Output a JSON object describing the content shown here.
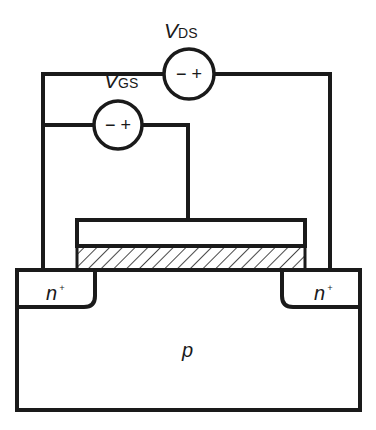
{
  "diagram": {
    "sources": [
      {
        "id": "vds",
        "symbol": "V",
        "subscript": "DS",
        "polarity": "− +"
      },
      {
        "id": "vgs",
        "symbol": "V",
        "subscript": "GS",
        "polarity": "− +"
      }
    ],
    "regions": {
      "source": {
        "label": "n",
        "superscript": "+"
      },
      "drain": {
        "label": "n",
        "superscript": "+"
      },
      "substrate": {
        "label": "p"
      }
    },
    "colors": {
      "line": "#1a1a1a",
      "background": "#ffffff"
    }
  }
}
